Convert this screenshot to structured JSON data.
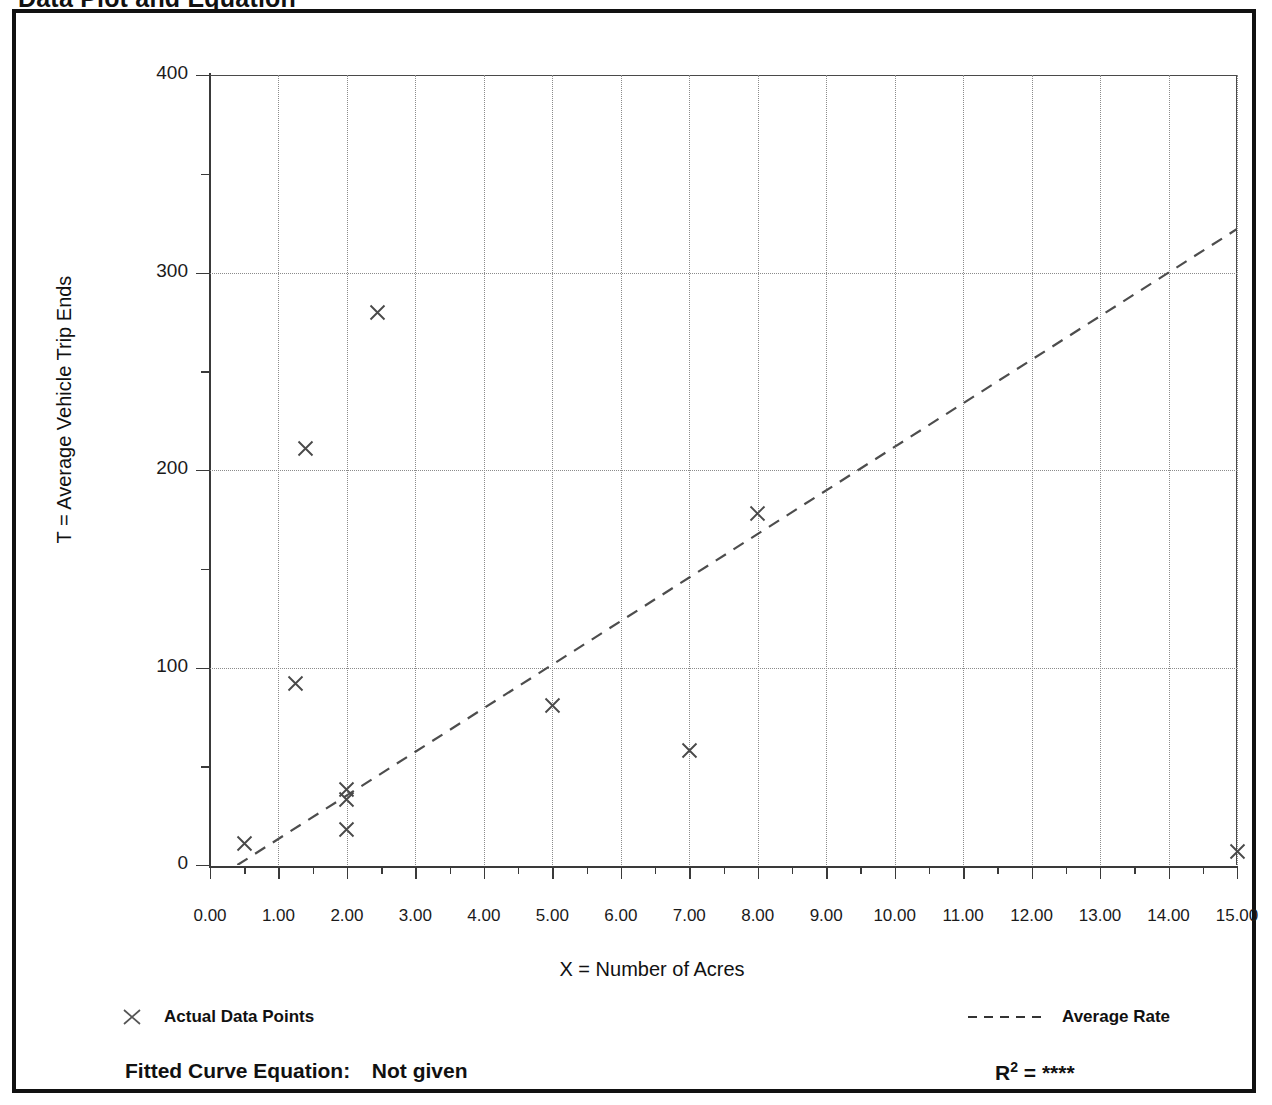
{
  "document": {
    "title": "Data Plot and Equation"
  },
  "legend": {
    "points_label": "Actual Data Points",
    "rate_label": "Average Rate",
    "point_marker_icon": "x-marker-icon",
    "rate_marker_icon": "dashed-line-icon"
  },
  "footer": {
    "equation_label": "Fitted Curve Equation:",
    "equation_value": "Not given",
    "r2_prefix": "R",
    "r2_exponent": "2",
    "r2_equals": " = ",
    "r2_value": "****"
  },
  "chart_data": {
    "type": "scatter",
    "title": "Data Plot and Equation",
    "xlabel": "X = Number of Acres",
    "ylabel": "T = Average Vehicle Trip Ends",
    "xlim": [
      0,
      15
    ],
    "ylim": [
      0,
      400
    ],
    "xticks": [
      "0.00",
      "1.00",
      "2.00",
      "3.00",
      "4.00",
      "5.00",
      "6.00",
      "7.00",
      "8.00",
      "9.00",
      "10.00",
      "11.00",
      "12.00",
      "13.00",
      "14.00",
      "15.00"
    ],
    "xtick_values": [
      0,
      1,
      2,
      3,
      4,
      5,
      6,
      7,
      8,
      9,
      10,
      11,
      12,
      13,
      14,
      15
    ],
    "xminor_step": 0.5,
    "yticks": [
      "0",
      "100",
      "200",
      "300",
      "400"
    ],
    "ytick_values": [
      0,
      100,
      200,
      300,
      400
    ],
    "yminor_step": 50,
    "grid": true,
    "grid_style": "dotted",
    "legend_position": "below-plot",
    "series": [
      {
        "name": "Actual Data Points",
        "marker": "x",
        "points": [
          {
            "x": 0.5,
            "y": 11
          },
          {
            "x": 1.25,
            "y": 92
          },
          {
            "x": 1.4,
            "y": 211
          },
          {
            "x": 2.0,
            "y": 38
          },
          {
            "x": 2.0,
            "y": 33
          },
          {
            "x": 2.0,
            "y": 18
          },
          {
            "x": 2.45,
            "y": 280
          },
          {
            "x": 5.0,
            "y": 81
          },
          {
            "x": 7.0,
            "y": 58
          },
          {
            "x": 8.0,
            "y": 178
          },
          {
            "x": 15.0,
            "y": 7
          }
        ]
      },
      {
        "name": "Average Rate",
        "type": "line",
        "style": "dashed",
        "points": [
          {
            "x": 0.4,
            "y": 0
          },
          {
            "x": 15.0,
            "y": 322
          }
        ]
      }
    ]
  }
}
